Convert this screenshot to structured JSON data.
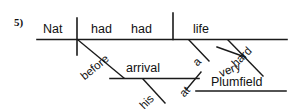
{
  "figure": {
    "item_number": "5)",
    "type": "reed-kellogg-sentence-diagram",
    "sentence": "Nat had had a very hard life at Plumfield before his arrival.",
    "ink_color": "#1a1a1a",
    "background_color": "#ffffff"
  },
  "baseline": {
    "subject": "Nat",
    "verb_aux": "had",
    "verb_main": "had",
    "direct_object": "life"
  },
  "modifiers": {
    "article_life": "a",
    "adjective_life": "hard",
    "adverb_hard": "very"
  },
  "prepositional_phrases": [
    {
      "preposition": "at",
      "object": "Plumfield",
      "attaches_to": "life"
    },
    {
      "preposition": "before",
      "object": "arrival",
      "modifier": "his",
      "attaches_to": "had"
    }
  ],
  "words": {
    "nat": "Nat",
    "had1": "had",
    "had2": "had",
    "life": "life",
    "a": "a",
    "hard": "hard",
    "very": "very",
    "at": "at",
    "plumfield": "Plumfield",
    "before": "before",
    "arrival": "arrival",
    "his": "his"
  }
}
